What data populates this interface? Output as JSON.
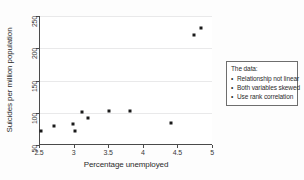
{
  "chart_data": {
    "type": "scatter",
    "title": "",
    "xlabel": "Percentage unemployed",
    "ylabel": "Suicides per million population",
    "xlim": [
      2.5,
      5.0
    ],
    "ylim": [
      50,
      250
    ],
    "xticks": [
      "2.5",
      "3",
      "3.5",
      "4",
      "4.5",
      "5"
    ],
    "xtick_values": [
      2.5,
      3,
      3.5,
      4,
      4.5,
      5
    ],
    "yticks": [
      "50",
      "100",
      "150",
      "200",
      "250"
    ],
    "ytick_values": [
      50,
      100,
      150,
      200,
      250
    ],
    "grid": true,
    "legend": "none",
    "marker_color": "#1a1a1a",
    "points": [
      {
        "x": 2.52,
        "y": 71
      },
      {
        "x": 2.7,
        "y": 80
      },
      {
        "x": 2.98,
        "y": 82
      },
      {
        "x": 3.0,
        "y": 72
      },
      {
        "x": 3.1,
        "y": 101
      },
      {
        "x": 3.2,
        "y": 92
      },
      {
        "x": 3.5,
        "y": 103
      },
      {
        "x": 3.8,
        "y": 103
      },
      {
        "x": 4.4,
        "y": 84
      },
      {
        "x": 4.72,
        "y": 221
      },
      {
        "x": 4.82,
        "y": 232
      }
    ]
  },
  "annotation": {
    "title": "The data:",
    "items": [
      "Relationship not linear",
      "Both variables skewed",
      "Use rank correlation"
    ]
  }
}
